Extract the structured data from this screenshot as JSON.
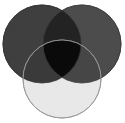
{
  "figure": {
    "background_color": "#ffffff",
    "width": 125,
    "height": 123
  },
  "chart_data": {
    "type": "venn",
    "title": "",
    "subtitle": "",
    "xlabel": "",
    "ylabel": "",
    "legend_position": "none",
    "grid": false,
    "background_color": "#ffffff",
    "blend_mode": "multiply",
    "canvas": {
      "width": 125,
      "height": 123
    },
    "sets": [
      {
        "id": "A",
        "name": "top-left-circle",
        "label": "",
        "cx": 42,
        "cy": 44,
        "r": 39,
        "fill": "#3f3f3f",
        "stroke": "#303030",
        "stroke_width": 0.8,
        "opacity": 1
      },
      {
        "id": "B",
        "name": "top-right-circle",
        "label": "",
        "cx": 82,
        "cy": 44,
        "r": 39,
        "fill": "#4c4c4c",
        "stroke": "#3a3a3a",
        "stroke_width": 0.8,
        "opacity": 1
      },
      {
        "id": "C",
        "name": "bottom-circle",
        "label": "",
        "cx": 62,
        "cy": 79,
        "r": 39,
        "fill": "#e8e8e8",
        "stroke": "#9a9a9a",
        "stroke_width": 0.9,
        "opacity": 1
      }
    ],
    "regions": [
      {
        "id": "A_only",
        "label": "",
        "sets": [
          "A"
        ],
        "fill": "#3f3f3f"
      },
      {
        "id": "B_only",
        "label": "",
        "sets": [
          "B"
        ],
        "fill": "#4c4c4c"
      },
      {
        "id": "C_only",
        "label": "",
        "sets": [
          "C"
        ],
        "fill": "#e8e8e8"
      },
      {
        "id": "AB",
        "label": "",
        "sets": [
          "A",
          "B"
        ],
        "fill": "#232323"
      },
      {
        "id": "AC",
        "label": "",
        "sets": [
          "A",
          "C"
        ],
        "fill": "#3a3a3a"
      },
      {
        "id": "BC",
        "label": "",
        "sets": [
          "B",
          "C"
        ],
        "fill": "#464646"
      },
      {
        "id": "ABC",
        "label": "",
        "sets": [
          "A",
          "B",
          "C"
        ],
        "fill": "#0a0a0a"
      }
    ]
  }
}
